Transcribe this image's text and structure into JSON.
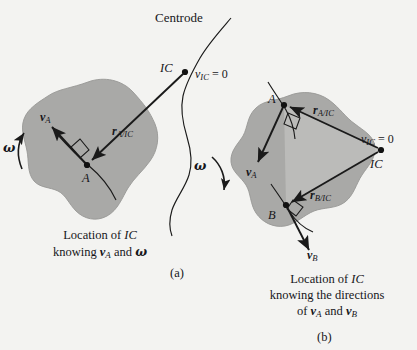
{
  "figure": {
    "title_label": "Centrode",
    "background_color": "#f3f3f1",
    "body_fill_color": "#a9a9a7",
    "body_stroke_color": "#8f8f8d",
    "highlight_fill_color": "#bcbcba",
    "line_color": "#1a1a1a"
  },
  "panel_a": {
    "tag": "(a)",
    "caption_line1": "Location of IC",
    "caption_line2": "knowing vA and ω",
    "caption_l2_pre": "knowing ",
    "caption_l2_v": "v",
    "caption_l2_sub": "A",
    "caption_l2_mid": " and ",
    "caption_l2_omega": "ω",
    "ic_label": "IC",
    "ic_velocity_label_main": "v",
    "ic_velocity_label_sub": "IC",
    "ic_velocity_label_eq": " = 0",
    "point_a_label": "A",
    "velocity_a_main": "v",
    "velocity_a_sub": "A",
    "position_vector_main": "r",
    "position_vector_sub": "A/IC",
    "omega_label": "ω",
    "omega_direction": "counterclockwise"
  },
  "panel_b": {
    "tag": "(b)",
    "caption_line1": "Location of IC",
    "caption_line2": "knowing the directions",
    "caption_line3": "of vA and vB",
    "caption_l3_pre": "of ",
    "caption_l3_v1": "v",
    "caption_l3_sub1": "A",
    "caption_l3_mid": " and ",
    "caption_l3_v2": "v",
    "caption_l3_sub2": "B",
    "ic_label": "IC",
    "ic_velocity_label_main": "v",
    "ic_velocity_label_sub": "IC",
    "ic_velocity_label_eq": " = 0",
    "point_a_label": "A",
    "point_b_label": "B",
    "velocity_a_main": "v",
    "velocity_a_sub": "A",
    "velocity_b_main": "v",
    "velocity_b_sub": "B",
    "position_vector_a_main": "r",
    "position_vector_a_sub": "A/IC",
    "position_vector_b_main": "r",
    "position_vector_b_sub": "B/IC",
    "omega_label": "ω",
    "omega_direction": "clockwise"
  }
}
